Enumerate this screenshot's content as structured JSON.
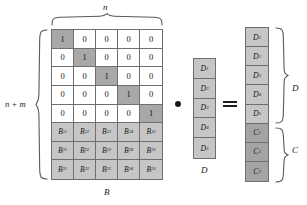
{
  "figure": {
    "type": "matrix-equation-diagram"
  },
  "matrix_b": {
    "name": "B",
    "bottom_label": "B",
    "top_brace_label": "n",
    "left_brace_label": "n + m",
    "rows": 8,
    "cols": 5,
    "identity_rows": [
      [
        "1",
        "0",
        "0",
        "0",
        "0"
      ],
      [
        "0",
        "1",
        "0",
        "0",
        "0"
      ],
      [
        "0",
        "0",
        "1",
        "0",
        "0"
      ],
      [
        "0",
        "0",
        "0",
        "1",
        "0"
      ],
      [
        "0",
        "0",
        "0",
        "0",
        "1"
      ]
    ],
    "b_rows": [
      [
        {
          "base": "B",
          "sub": "11"
        },
        {
          "base": "B",
          "sub": "12"
        },
        {
          "base": "B",
          "sub": "13"
        },
        {
          "base": "B",
          "sub": "14"
        },
        {
          "base": "B",
          "sub": "15"
        }
      ],
      [
        {
          "base": "B",
          "sub": "21"
        },
        {
          "base": "B",
          "sub": "22"
        },
        {
          "base": "B",
          "sub": "23"
        },
        {
          "base": "B",
          "sub": "24"
        },
        {
          "base": "B",
          "sub": "25"
        }
      ],
      [
        {
          "base": "B",
          "sub": "31"
        },
        {
          "base": "B",
          "sub": "32"
        },
        {
          "base": "B",
          "sub": "33"
        },
        {
          "base": "B",
          "sub": "34"
        },
        {
          "base": "B",
          "sub": "35"
        }
      ]
    ]
  },
  "vector_d": {
    "name": "D",
    "bottom_label": "D",
    "entries": [
      {
        "base": "D",
        "sub": "1"
      },
      {
        "base": "D",
        "sub": "2"
      },
      {
        "base": "D",
        "sub": "3"
      },
      {
        "base": "D",
        "sub": "4"
      },
      {
        "base": "D",
        "sub": "5"
      }
    ]
  },
  "vector_result": {
    "d_brace_label": "D",
    "c_brace_label": "C",
    "d_entries": [
      {
        "base": "D",
        "sub": "1"
      },
      {
        "base": "D",
        "sub": "2"
      },
      {
        "base": "D",
        "sub": "3"
      },
      {
        "base": "D",
        "sub": "4"
      },
      {
        "base": "D",
        "sub": "5"
      }
    ],
    "c_entries": [
      {
        "base": "C",
        "sub": "1"
      },
      {
        "base": "C",
        "sub": "2"
      },
      {
        "base": "C",
        "sub": "3"
      }
    ]
  },
  "operators": {
    "multiply": "dot-operator",
    "equals": "equals-operator"
  },
  "colors": {
    "background": "#ffffff",
    "border": "#6f6f6f",
    "diagonal_fill": "#a8a8a8",
    "b_block_fill": "#c6c6c6",
    "d_fill": "#c6c6c6",
    "c_fill": "#a4a4a4",
    "text": "#1a1a1a"
  }
}
